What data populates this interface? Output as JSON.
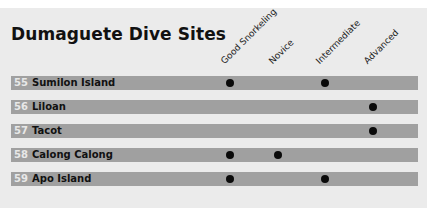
{
  "title": "Dumaguete Dive Sites",
  "columns": [
    {
      "label": "Good Snorkeling",
      "x": 230
    },
    {
      "label": "Novice",
      "x": 278
    },
    {
      "label": "Intermediate",
      "x": 325
    },
    {
      "label": "Advanced",
      "x": 373
    }
  ],
  "sites": [
    {
      "number": "55",
      "name": "Sumilon Island",
      "good_snorkeling": true,
      "novice": false,
      "intermediate": true,
      "advanced": false
    },
    {
      "number": "56",
      "name": "Liloan",
      "good_snorkeling": false,
      "novice": false,
      "intermediate": false,
      "advanced": true
    },
    {
      "number": "57",
      "name": "Tacot",
      "good_snorkeling": false,
      "novice": false,
      "intermediate": false,
      "advanced": true
    },
    {
      "number": "58",
      "name": "Calong Calong",
      "good_snorkeling": true,
      "novice": true,
      "intermediate": false,
      "advanced": false
    },
    {
      "number": "59",
      "name": "Apo Island",
      "good_snorkeling": true,
      "novice": false,
      "intermediate": true,
      "advanced": false
    }
  ],
  "colors": {
    "bar": "#a0a0a0",
    "background": "#ebebeb",
    "dot": "#0a0a0a"
  }
}
